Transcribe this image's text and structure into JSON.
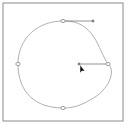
{
  "canvas": {
    "frame": {
      "x": 3,
      "y": 3,
      "w": 120,
      "h": 118,
      "stroke": "#8a8a8a"
    },
    "path": {
      "stroke": "#b0b0b0",
      "d": "M63,21 C95,20 98,50 108,64 C116,70 110,90 90,100 C80,106 72,108 63,108 C35,108 18,92 18,64 C18,38 38,21 63,21 Z"
    },
    "anchors": [
      {
        "name": "top",
        "x": 63,
        "y": 21
      },
      {
        "name": "left",
        "x": 18,
        "y": 64
      },
      {
        "name": "bottom",
        "x": 63,
        "y": 108
      },
      {
        "name": "right",
        "x": 108,
        "y": 64
      }
    ],
    "handles": [
      {
        "name": "top-handle",
        "x1": 63,
        "y1": 21,
        "x2": 93,
        "y2": 21
      },
      {
        "name": "right-handle",
        "x1": 108,
        "y1": 64,
        "x2": 79,
        "y2": 64
      }
    ],
    "handle_color": "#7a7a7a",
    "cursor": {
      "x": 80,
      "y": 65,
      "color": "#111111"
    }
  }
}
